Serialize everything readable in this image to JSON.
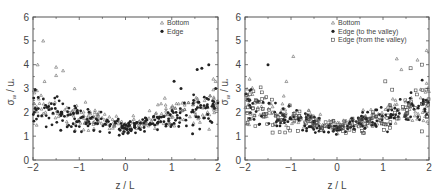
{
  "chart_data": [
    {
      "type": "scatter",
      "panel": "left",
      "title": "",
      "xlabel": "z / L",
      "ylabel": "σw / u*",
      "xlim": [
        -2,
        2
      ],
      "ylim": [
        0,
        6
      ],
      "xticks": [
        "-2",
        "-1",
        "0",
        "1",
        "2"
      ],
      "yticks": [
        "0",
        "1",
        "2",
        "3",
        "4",
        "5",
        "6"
      ],
      "grid": false,
      "legend_position": "upper right",
      "series": [
        {
          "name": "Bottom",
          "marker": "open-triangle",
          "trend": "V-shaped, minimum ~1.3 at z/L=0, ~2.2 at z/L=-2, ~2.4 at z/L=2",
          "notable_points": [
            [
              -1.78,
              5.0
            ],
            [
              -1.9,
              4.0
            ],
            [
              -1.5,
              3.9
            ],
            [
              -1.5,
              3.55
            ],
            [
              -1.35,
              3.75
            ],
            [
              -1.75,
              3.3
            ],
            [
              -1.1,
              3.0
            ],
            [
              1.9,
              3.4
            ],
            [
              1.95,
              3.3
            ],
            [
              0.85,
              2.6
            ]
          ]
        },
        {
          "name": "Edge",
          "marker": "filled-circle",
          "trend": "V-shaped, minimum ~1.3 at z/L=0, ~2.1 at z/L=-2, ~2.2 at z/L=2",
          "notable_points": [
            [
              1.55,
              3.8
            ],
            [
              1.65,
              3.85
            ],
            [
              1.8,
              4.0
            ],
            [
              1.05,
              3.3
            ],
            [
              1.2,
              3.0
            ],
            [
              -1.95,
              2.95
            ],
            [
              1.45,
              1.1
            ],
            [
              -1.4,
              1.25
            ],
            [
              -1.1,
              1.2
            ],
            [
              1.95,
              3.0
            ]
          ]
        }
      ]
    },
    {
      "type": "scatter",
      "panel": "right",
      "title": "",
      "xlabel": "z / L",
      "ylabel": "σw / u*",
      "xlim": [
        -2,
        2
      ],
      "ylim": [
        0,
        6
      ],
      "xticks": [
        "-2",
        "-1",
        "0",
        "1",
        "2"
      ],
      "yticks": [
        "0",
        "1",
        "2",
        "3",
        "4",
        "5",
        "6"
      ],
      "grid": false,
      "legend_position": "upper right",
      "series": [
        {
          "name": "Bottom",
          "marker": "open-triangle",
          "trend": "V-shaped, minimum ~1.3 at z/L=0",
          "notable_points": [
            [
              -0.95,
              4.35
            ],
            [
              1.3,
              4.25
            ],
            [
              1.95,
              4.6
            ],
            [
              1.75,
              4.2
            ],
            [
              -1.1,
              3.3
            ],
            [
              -1.9,
              3.4
            ],
            [
              1.4,
              3.8
            ]
          ]
        },
        {
          "name": "Edge (to the valley)",
          "marker": "filled-circle",
          "trend": "V-shaped, minimum ~1.25 at z/L=0",
          "notable_points": [
            [
              -1.5,
              4.0
            ],
            [
              -1.9,
              2.3
            ],
            [
              0.0,
              1.25
            ]
          ]
        },
        {
          "name": "Edge (from the valley)",
          "marker": "open-square",
          "trend": "V-shaped, minimum ~1.2 at z/L=0, ~2.2 at z/L=-2, ~2.5 at z/L=2",
          "notable_points": [
            [
              1.85,
              4.0
            ],
            [
              1.6,
              3.85
            ],
            [
              1.05,
              3.3
            ],
            [
              1.2,
              2.95
            ],
            [
              -1.4,
              1.15
            ],
            [
              1.85,
              1.2
            ]
          ]
        }
      ]
    }
  ],
  "panels": [
    {
      "id": "left",
      "ylabel_main": "σ",
      "ylabel_sub": "w",
      "ylabel_rest": " / u",
      "ylabel_sub2": "*",
      "xlabel": "z / L",
      "legend": [
        {
          "label": "Bottom",
          "marker": "triangle"
        },
        {
          "label": "Edge",
          "marker": "circle"
        }
      ]
    },
    {
      "id": "right",
      "ylabel_main": "σ",
      "ylabel_sub": "w",
      "ylabel_rest": " / u",
      "ylabel_sub2": "*",
      "xlabel": "z / L",
      "legend": [
        {
          "label": "Bottom",
          "marker": "triangle"
        },
        {
          "label": "Edge (to the valley)",
          "marker": "circle"
        },
        {
          "label": "Edge (from the valley)",
          "marker": "square"
        }
      ]
    }
  ],
  "colors": {
    "axis": "#555555",
    "marker": "#222222",
    "background": "#ffffff"
  }
}
